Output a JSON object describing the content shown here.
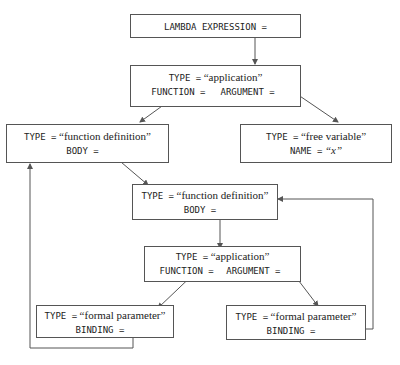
{
  "nodes": {
    "root": {
      "label": "LAMBDA EXPRESSION ="
    },
    "app1": {
      "type_key": "TYPE =",
      "type_val": "“application”",
      "f_key": "FUNCTION =",
      "a_key": "ARGUMENT ="
    },
    "fdef1": {
      "type_key": "TYPE =",
      "type_val": "“function definition”",
      "body_key": "BODY ="
    },
    "freevar": {
      "type_key": "TYPE =",
      "type_val": "“free variable”",
      "name_key": "NAME =",
      "name_val": "“x”"
    },
    "fdef2": {
      "type_key": "TYPE =",
      "type_val": "“function definition”",
      "body_key": "BODY ="
    },
    "app2": {
      "type_key": "TYPE =",
      "type_val": "“application”",
      "f_key": "FUNCTION =",
      "a_key": "ARGUMENT ="
    },
    "formal1": {
      "type_key": "TYPE =",
      "type_val": "“formal parameter”",
      "binding_key": "BINDING ="
    },
    "formal2": {
      "type_key": "TYPE =",
      "type_val": "“formal parameter”",
      "binding_key": "BINDING ="
    }
  },
  "colors": {
    "line": "#555555",
    "text": "#222222"
  }
}
